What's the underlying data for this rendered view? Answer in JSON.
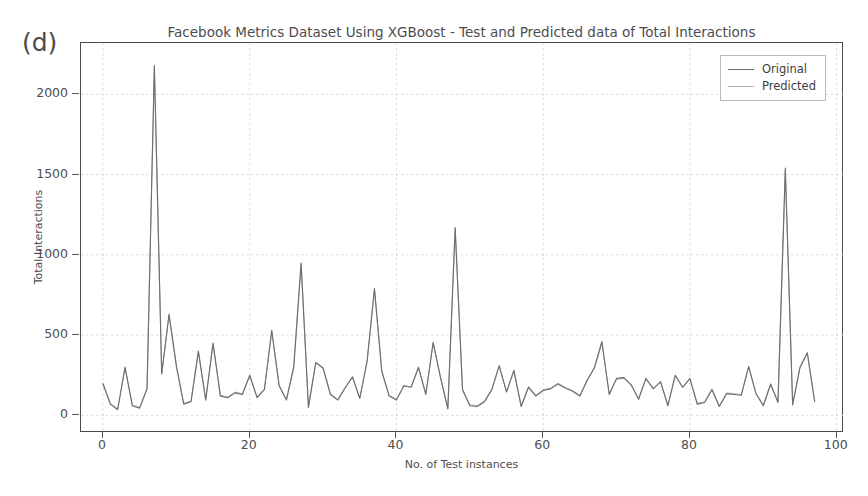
{
  "panel": {
    "label": "(d)"
  },
  "legend": {
    "position": "upper-right",
    "entries": [
      {
        "label": "Original",
        "color": "#6e6e6e"
      },
      {
        "label": "Predicted",
        "color": "#b4b4b4"
      }
    ]
  },
  "axes": {
    "ylabel": "Total Interactions",
    "xlabel": "No. of Test instances",
    "yticks": [
      0,
      500,
      1000,
      1500,
      2000
    ],
    "xticks": [
      0,
      20,
      40,
      60,
      80,
      100
    ],
    "xlim": [
      -3,
      101
    ],
    "ylim": [
      -110,
      2320
    ],
    "grid": true,
    "grid_color": "#d8d8d8",
    "frame_color": "#4b4b4b"
  },
  "chart_data": {
    "type": "line",
    "title": "Facebook Metrics Dataset Using XGBoost - Test and Predicted data of Total Interactions",
    "xlabel": "No. of Test instances",
    "ylabel": "Total Interactions",
    "xlim": [
      -3,
      101
    ],
    "ylim": [
      -110,
      2320
    ],
    "grid": true,
    "legend_position": "upper right",
    "x": [
      0,
      1,
      2,
      3,
      4,
      5,
      6,
      7,
      8,
      9,
      10,
      11,
      12,
      13,
      14,
      15,
      16,
      17,
      18,
      19,
      20,
      21,
      22,
      23,
      24,
      25,
      26,
      27,
      28,
      29,
      30,
      31,
      32,
      33,
      34,
      35,
      36,
      37,
      38,
      39,
      40,
      41,
      42,
      43,
      44,
      45,
      46,
      47,
      48,
      49,
      50,
      51,
      52,
      53,
      54,
      55,
      56,
      57,
      58,
      59,
      60,
      61,
      62,
      63,
      64,
      65,
      66,
      67,
      68,
      69,
      70,
      71,
      72,
      73,
      74,
      75,
      76,
      77,
      78,
      79,
      80,
      81,
      82,
      83,
      84,
      85,
      86,
      87,
      88,
      89,
      90,
      91,
      92,
      93,
      94,
      95,
      96,
      97
    ],
    "series": [
      {
        "name": "Original",
        "color": "#6e6e6e",
        "values": [
          195,
          70,
          35,
          300,
          60,
          45,
          165,
          2180,
          260,
          630,
          310,
          70,
          85,
          400,
          95,
          450,
          120,
          110,
          140,
          130,
          250,
          110,
          160,
          530,
          185,
          95,
          300,
          950,
          50,
          330,
          295,
          130,
          95,
          170,
          240,
          105,
          340,
          790,
          275,
          120,
          95,
          185,
          175,
          300,
          130,
          455,
          235,
          40,
          1170,
          160,
          60,
          55,
          85,
          160,
          310,
          145,
          280,
          55,
          175,
          120,
          155,
          165,
          195,
          170,
          150,
          120,
          220,
          300,
          460,
          130,
          230,
          235,
          190,
          100,
          230,
          165,
          210,
          60,
          250,
          175,
          230,
          70,
          80,
          160,
          55,
          135,
          130,
          125,
          305,
          135,
          60,
          195,
          80,
          1540,
          65,
          300,
          390,
          85
        ]
      },
      {
        "name": "Predicted",
        "color": "#b4b4b4",
        "values": [
          200,
          75,
          40,
          295,
          62,
          50,
          170,
          2160,
          255,
          625,
          300,
          75,
          90,
          395,
          100,
          445,
          125,
          115,
          145,
          135,
          245,
          115,
          165,
          520,
          190,
          100,
          305,
          940,
          55,
          325,
          290,
          135,
          100,
          175,
          235,
          110,
          335,
          780,
          270,
          125,
          100,
          180,
          180,
          295,
          135,
          450,
          240,
          45,
          1160,
          165,
          65,
          60,
          90,
          165,
          305,
          150,
          275,
          60,
          180,
          125,
          160,
          170,
          200,
          175,
          155,
          125,
          215,
          295,
          450,
          135,
          225,
          230,
          185,
          105,
          225,
          170,
          205,
          65,
          245,
          180,
          225,
          75,
          85,
          165,
          60,
          140,
          135,
          130,
          300,
          140,
          65,
          190,
          85,
          1520,
          70,
          295,
          385,
          90
        ]
      }
    ]
  }
}
